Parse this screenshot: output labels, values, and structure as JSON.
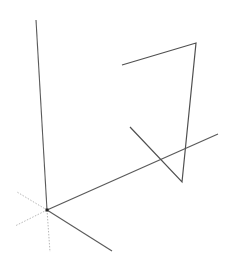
{
  "viewport": {
    "width": 232,
    "height": 253,
    "background": "#ffffff"
  },
  "colors": {
    "solid_axis": "#5a5a5a",
    "edge": "#505050",
    "dotted_axis": "#b8b8b8",
    "origin_marker": "#222222"
  },
  "origin": {
    "x": 47,
    "y": 210
  },
  "axes": {
    "positive": [
      {
        "name": "blue-axis-positive",
        "x1": 47,
        "y1": 210,
        "x2": 36,
        "y2": 20
      },
      {
        "name": "red-axis-positive",
        "x1": 47,
        "y1": 210,
        "x2": 218,
        "y2": 134
      },
      {
        "name": "green-axis-positive",
        "x1": 47,
        "y1": 210,
        "x2": 112,
        "y2": 251
      }
    ],
    "negative_dotted": [
      {
        "name": "green-axis-negative",
        "x1": 47,
        "y1": 210,
        "x2": 17,
        "y2": 192
      },
      {
        "name": "red-axis-negative",
        "x1": 47,
        "y1": 210,
        "x2": 15,
        "y2": 226
      },
      {
        "name": "blue-axis-negative",
        "x1": 47,
        "y1": 210,
        "x2": 50,
        "y2": 252
      }
    ]
  },
  "edges": {
    "polyline_points": [
      {
        "x": 122,
        "y": 65
      },
      {
        "x": 196,
        "y": 43
      },
      {
        "x": 182,
        "y": 182
      },
      {
        "x": 130,
        "y": 127
      }
    ]
  }
}
